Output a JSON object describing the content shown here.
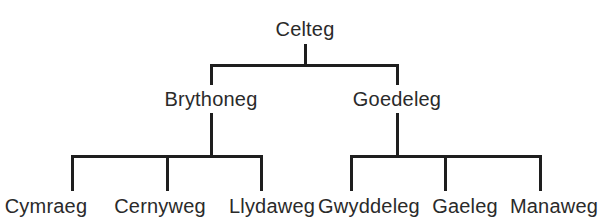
{
  "diagram": {
    "type": "tree",
    "root": {
      "label": "Celteg",
      "children": [
        {
          "label": "Brythoneg",
          "children": [
            {
              "label": "Cymraeg"
            },
            {
              "label": "Cernyweg"
            },
            {
              "label": "Llydaweg"
            }
          ]
        },
        {
          "label": "Goedeleg",
          "children": [
            {
              "label": "Gwyddeleg"
            },
            {
              "label": "Gaeleg"
            },
            {
              "label": "Manaweg"
            }
          ]
        }
      ]
    },
    "colors": {
      "line": "#1e1e1e",
      "text": "#2a2a2a",
      "background": "#ffffff"
    }
  }
}
